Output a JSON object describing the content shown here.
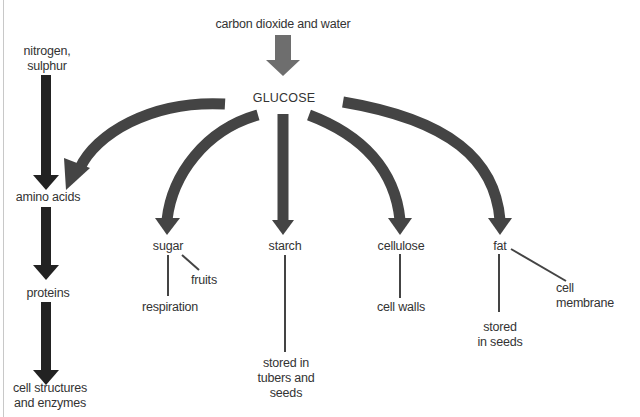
{
  "diagram": {
    "title": "",
    "colors": {
      "source_arrow": "#6e6e6e",
      "glucose_arrows": "#444444",
      "nitrogen_chain_arrows": "#222222",
      "lines": "#444444",
      "text": "#333333"
    },
    "nodes": {
      "source": "carbon dioxide and water",
      "glucose": "GLUCOSE",
      "nitrogen": [
        "nitrogen,",
        "sulphur"
      ],
      "amino_acids": "amino acids",
      "proteins": "proteins",
      "cell_structures": [
        "cell structures",
        "and enzymes"
      ],
      "sugar": "sugar",
      "fruits": "fruits",
      "respiration": "respiration",
      "starch": "starch",
      "starch_use": [
        "stored in",
        "tubers and",
        "seeds"
      ],
      "cellulose": "cellulose",
      "cell_walls": "cell walls",
      "fat": "fat",
      "fat_stored": [
        "stored",
        "in seeds"
      ],
      "cell_membrane": [
        "cell",
        "membrane"
      ]
    },
    "edges": [
      {
        "from": "carbon dioxide and water",
        "to": "GLUCOSE",
        "type": "arrow"
      },
      {
        "from": "GLUCOSE",
        "to": "amino acids",
        "type": "curved-arrow"
      },
      {
        "from": "GLUCOSE",
        "to": "sugar",
        "type": "curved-arrow"
      },
      {
        "from": "GLUCOSE",
        "to": "starch",
        "type": "arrow"
      },
      {
        "from": "GLUCOSE",
        "to": "cellulose",
        "type": "curved-arrow"
      },
      {
        "from": "GLUCOSE",
        "to": "fat",
        "type": "curved-arrow"
      },
      {
        "from": "nitrogen, sulphur",
        "to": "amino acids",
        "type": "arrow"
      },
      {
        "from": "amino acids",
        "to": "proteins",
        "type": "arrow"
      },
      {
        "from": "proteins",
        "to": "cell structures and enzymes",
        "type": "arrow"
      },
      {
        "from": "sugar",
        "to": "fruits",
        "type": "line"
      },
      {
        "from": "sugar",
        "to": "respiration",
        "type": "line"
      },
      {
        "from": "starch",
        "to": "stored in tubers and seeds",
        "type": "line"
      },
      {
        "from": "cellulose",
        "to": "cell walls",
        "type": "line"
      },
      {
        "from": "fat",
        "to": "stored in seeds",
        "type": "line"
      },
      {
        "from": "fat",
        "to": "cell membrane",
        "type": "line"
      }
    ]
  }
}
